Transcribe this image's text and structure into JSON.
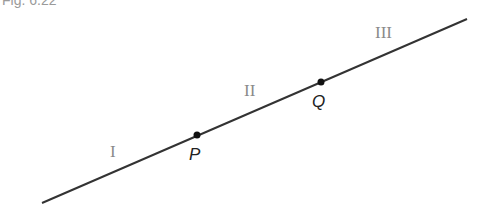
{
  "figure": {
    "label": "Fig. 6.22",
    "line": {
      "x1": 42,
      "y1": 203,
      "x2": 467,
      "y2": 19,
      "color": "#333333"
    },
    "points": [
      {
        "name": "P",
        "x": 197,
        "y": 135,
        "label_x": 190,
        "label_y": 160
      },
      {
        "name": "Q",
        "x": 321,
        "y": 82,
        "label_x": 313,
        "label_y": 107
      }
    ],
    "regions": [
      {
        "name": "I",
        "x": 114,
        "y": 157
      },
      {
        "name": "II",
        "x": 245,
        "y": 96
      },
      {
        "name": "III",
        "x": 376,
        "y": 38
      }
    ]
  }
}
